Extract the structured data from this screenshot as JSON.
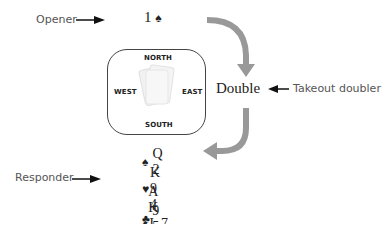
{
  "labels": {
    "opener": "Opener",
    "takeout": "Takeout doubler",
    "responder": "Responder"
  },
  "bids": {
    "opening": "1",
    "opening_suit": "♠",
    "double": "Double"
  },
  "compass": {
    "north": "NORTH",
    "south": "SOUTH",
    "east": "EAST",
    "west": "WEST"
  },
  "hand": [
    {
      "suit": "♠",
      "cards": "Q 2"
    },
    {
      "suit": "♥",
      "cards": "K 9 4"
    },
    {
      "suit": "♦",
      "cards": "A K J 7 5 3"
    },
    {
      "suit": "♣",
      "cards": "9 5"
    }
  ],
  "colors": {
    "arrow_gray": "#999999",
    "text": "#222222",
    "label": "#555555"
  }
}
